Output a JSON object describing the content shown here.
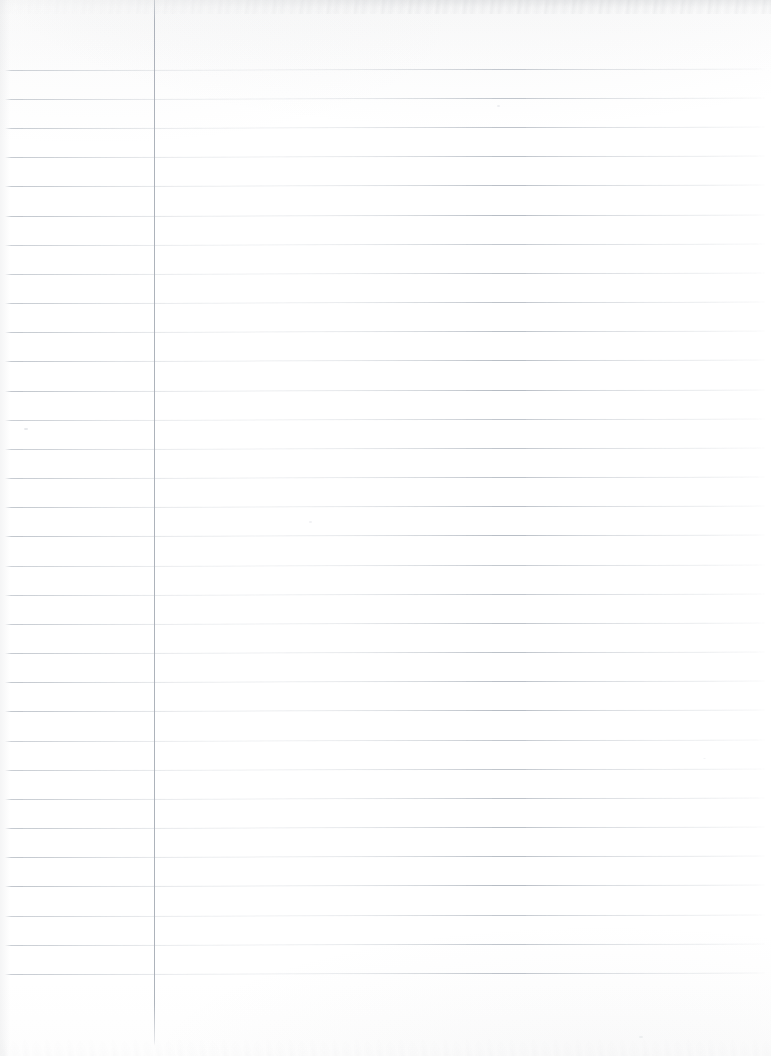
{
  "document": {
    "kind": "scanned-lined-paper",
    "title": "Blank Ruled Notebook Page",
    "page_width": 771,
    "page_height": 1056,
    "paper_color": "#ffffff",
    "content_text": "",
    "is_blank": true
  },
  "ruling": {
    "line_color": "#b6bcc4",
    "margin_line_color": "#a9afb8",
    "line_thickness_px": 1,
    "line_spacing_px": 29.2,
    "first_line_y": 70,
    "line_count": 32,
    "line_start_x": 5,
    "line_end_x": 767,
    "line_tilt_deg": -0.12,
    "margin_line_x": 154,
    "margin_line_top_y": 0,
    "margin_line_bottom_y": 1046,
    "line_y_positions": [
      70,
      99,
      128,
      157,
      186,
      216,
      245,
      274,
      303,
      332,
      361,
      391,
      420,
      449,
      478,
      507,
      536,
      566,
      595,
      624,
      653,
      682,
      711,
      741,
      770,
      799,
      828,
      857,
      886,
      916,
      945,
      974
    ]
  },
  "scan_artifacts": {
    "top_noise_band_height": 14,
    "bottom_noise_band_height": 22,
    "left_edge_shade_width": 10,
    "noise_color": "#8e929a",
    "specks": [
      {
        "x": 24,
        "y": 428,
        "w": 4,
        "h": 2,
        "opacity": 0.45
      },
      {
        "x": 497,
        "y": 105,
        "w": 3,
        "h": 2,
        "opacity": 0.3
      },
      {
        "x": 309,
        "y": 521,
        "w": 3,
        "h": 2,
        "opacity": 0.26
      },
      {
        "x": 639,
        "y": 1036,
        "w": 4,
        "h": 2,
        "opacity": 0.25
      },
      {
        "x": 703,
        "y": 758,
        "w": 3,
        "h": 1,
        "opacity": 0.22
      }
    ]
  }
}
